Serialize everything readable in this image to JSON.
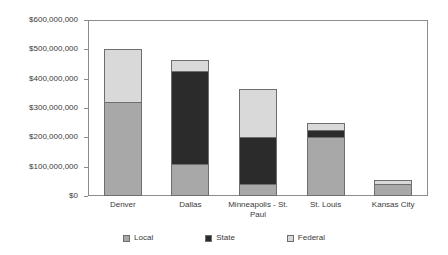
{
  "chart_data": {
    "type": "bar",
    "subtype": "stacked-bar",
    "title": "",
    "xlabel": "",
    "ylabel": "",
    "categories": [
      "Denver",
      "Dallas",
      "Minneapolis - St. Paul",
      "St. Louis",
      "Kansas City"
    ],
    "series": [
      {
        "name": "Local",
        "color": "#a8a8a8",
        "values": [
          320000000,
          110000000,
          40000000,
          200000000,
          40000000
        ]
      },
      {
        "name": "State",
        "color": "#2b2b2b",
        "values": [
          0,
          315000000,
          160000000,
          25000000,
          0
        ]
      },
      {
        "name": "Federal",
        "color": "#d9d9d9",
        "values": [
          180000000,
          40000000,
          165000000,
          25000000,
          15000000
        ]
      }
    ],
    "totals": [
      500000000,
      465000000,
      365000000,
      250000000,
      55000000
    ],
    "ylim": [
      0,
      600000000
    ],
    "ytick_values": [
      0,
      100000000,
      200000000,
      300000000,
      400000000,
      500000000,
      600000000
    ],
    "ytick_labels": [
      "$0",
      "$100,000,000",
      "$200,000,000",
      "$300,000,000",
      "$400,000,000",
      "$500,000,000",
      "$600,000,000"
    ],
    "grid": false,
    "legend_position": "bottom",
    "legend": [
      "Local",
      "State",
      "Federal"
    ]
  },
  "axis": {
    "y_labels": [
      "$600,000,000",
      "$500,000,000",
      "$400,000,000",
      "$300,000,000",
      "$200,000,000",
      "$100,000,000",
      "$0"
    ],
    "x_labels": [
      "Denver",
      "Dallas",
      "Minneapolis - St. Paul",
      "St. Louis",
      "Kansas City"
    ]
  },
  "legend": {
    "items": [
      {
        "label": "Local",
        "swatch": "local-swatch"
      },
      {
        "label": "State",
        "swatch": "state-swatch"
      },
      {
        "label": "Federal",
        "swatch": "federal-swatch"
      }
    ]
  },
  "colors": {
    "local": "#a8a8a8",
    "state": "#2b2b2b",
    "federal": "#d9d9d9",
    "axis": "#8c8c8c",
    "bar_border": "#6e6e6e",
    "text": "#3a3a3a",
    "background": "#ffffff"
  }
}
